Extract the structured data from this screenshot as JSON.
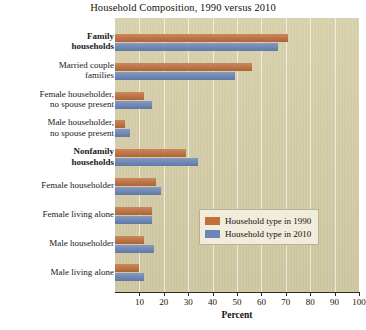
{
  "chart_data": {
    "type": "bar",
    "orientation": "horizontal",
    "title": "Household Composition, 1990 versus 2010",
    "xlabel": "Percent",
    "ylabel": "",
    "xlim": [
      0,
      100
    ],
    "grid": true,
    "legend_position": "center-right",
    "xticks": [
      10,
      20,
      30,
      40,
      50,
      60,
      70,
      80,
      90,
      100
    ],
    "categories": [
      "Family households",
      "Married couple families",
      "Female householder, no spouse present",
      "Male householder, no spouse present",
      "Nonfamily households",
      "Female householder",
      "Female living alone",
      "Male householder",
      "Male living alone"
    ],
    "category_lines": [
      [
        "Family",
        "households"
      ],
      [
        "Married couple",
        "families"
      ],
      [
        "Female householder,",
        "no spouse present"
      ],
      [
        "Male householder,",
        "no spouse present"
      ],
      [
        "Nonfamily",
        "households"
      ],
      [
        "Female householder"
      ],
      [
        "Female living alone"
      ],
      [
        "Male householder"
      ],
      [
        "Male living alone"
      ]
    ],
    "category_bold": [
      true,
      false,
      false,
      false,
      true,
      false,
      false,
      false,
      false
    ],
    "series": [
      {
        "name": "Household type in 1990",
        "color": "#c1703c",
        "values": [
          71,
          56,
          12,
          4,
          29,
          17,
          15,
          12,
          10
        ]
      },
      {
        "name": "Household type in 2010",
        "color": "#6c86b7",
        "values": [
          67,
          49,
          15,
          6,
          34,
          19,
          15,
          16,
          12
        ]
      }
    ]
  },
  "legend": {
    "entries": [
      {
        "label": "Household type in 1990",
        "color": "#c1703c"
      },
      {
        "label": "Household type in 2010",
        "color": "#6c86b7"
      }
    ]
  },
  "colors": {
    "series_1990": "#c1703c",
    "series_2010": "#6c86b7",
    "plot_background": "#d4cda6",
    "page_background": "#ffffff",
    "gridline": "#ffffff",
    "legend_background": "#f2ecdc"
  }
}
